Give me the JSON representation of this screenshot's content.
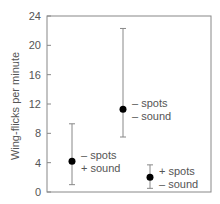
{
  "chart_data": {
    "type": "scatter",
    "title": "",
    "xlabel": "",
    "ylabel": "Wing-flicks per minute",
    "ylim": [
      0,
      24
    ],
    "yticks": [
      0,
      4,
      8,
      12,
      16,
      20,
      24
    ],
    "grid": false,
    "legend": "none",
    "points": [
      {
        "label_line1": "– spots",
        "label_line2": "+ sound",
        "mean": 4.2,
        "err_low": 1.0,
        "err_high": 9.3
      },
      {
        "label_line1": "– spots",
        "label_line2": "– sound",
        "mean": 11.3,
        "err_low": 7.5,
        "err_high": 22.3
      },
      {
        "label_line1": "+ spots",
        "label_line2": "– sound",
        "mean": 2.0,
        "err_low": 0.5,
        "err_high": 3.7
      }
    ],
    "colors": {
      "axis": "#888888",
      "point": "#000000",
      "errorbar": "#888888",
      "text": "#555555"
    }
  }
}
